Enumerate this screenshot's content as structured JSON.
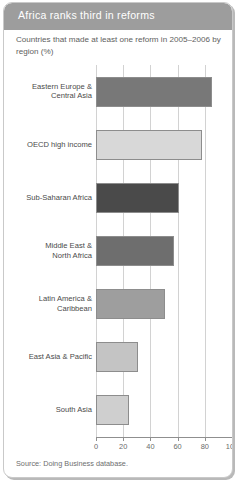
{
  "header": {
    "title": "Africa ranks third in reforms"
  },
  "subtitle": "Countries that made at least one reform in 2005–2006 by region (%)",
  "source": "Source: Doing Business database.",
  "colors": {
    "header_band": "#9d9d9d",
    "card_border": "#c9c9c9",
    "gridline": "#d2d2d2",
    "axis": "#8f8f8f",
    "text": "#4a4a4a"
  },
  "chart_data": {
    "type": "bar",
    "orientation": "horizontal",
    "title": "Africa ranks third in reforms",
    "subtitle": "Countries that made at least one reform in 2005–2006 by region (%)",
    "xlabel": "",
    "ylabel": "",
    "xlim": [
      0,
      100
    ],
    "xticks": [
      0,
      20,
      40,
      60,
      80,
      100
    ],
    "xtick_labels": [
      "0",
      "20",
      "40",
      "60",
      "80",
      "100"
    ],
    "grid": true,
    "legend": false,
    "categories": [
      "Eastern Europe & Central Asia",
      "OECD high income",
      "Sub-Saharan Africa",
      "Middle East & North Africa",
      "Latin America & Caribbean",
      "East Asia & Pacific",
      "South Asia"
    ],
    "values": [
      85,
      78,
      61,
      57,
      51,
      31,
      24
    ],
    "bar_colors": [
      "#787878",
      "#d8d8d8",
      "#4a4a4a",
      "#6e6e6e",
      "#9e9e9e",
      "#c4c4c4",
      "#cfcfcf"
    ]
  }
}
